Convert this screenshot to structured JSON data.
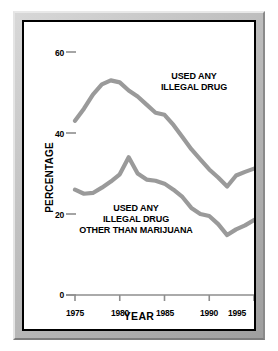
{
  "chart_data": {
    "type": "line",
    "title": "",
    "xlabel": "YEAR",
    "ylabel": "PERCENTAGE",
    "xlim": [
      1975,
      1995
    ],
    "ylim": [
      0,
      60
    ],
    "grid": false,
    "legend_position": "inline-annotation",
    "xticks": [
      "1975",
      "1980",
      "1985",
      "1990",
      "1995"
    ],
    "xtick_values": [
      1975,
      1980,
      1985,
      1990,
      1995
    ],
    "yticks": [
      "0",
      "20",
      "40",
      "60"
    ],
    "ytick_values": [
      0,
      20,
      40,
      60
    ],
    "line_color": "#9a9a9a",
    "axis_color": "#8e8e8e",
    "text_color": "#000000",
    "x": [
      1975,
      1976,
      1977,
      1978,
      1979,
      1980,
      1981,
      1982,
      1983,
      1984,
      1985,
      1986,
      1987,
      1988,
      1989,
      1990,
      1991,
      1992,
      1993,
      1994,
      1995
    ],
    "series": [
      {
        "name": "USED ANY ILLEGAL DRUG",
        "annotation": [
          "USED ANY",
          "ILLEGAL DRUG"
        ],
        "values": [
          43.0,
          46.0,
          49.5,
          52.0,
          53.0,
          52.5,
          50.5,
          49.0,
          47.0,
          45.0,
          44.5,
          42.0,
          39.0,
          36.0,
          33.5,
          31.0,
          29.0,
          26.8,
          29.5,
          30.4,
          31.2
        ]
      },
      {
        "name": "USED ANY ILLEGAL DRUG OTHER THAN MARIJUANA",
        "annotation": [
          "USED ANY",
          "ILLEGAL DRUG",
          "OTHER THAN MARIJUANA"
        ],
        "values": [
          26.0,
          25.0,
          25.2,
          26.5,
          28.0,
          29.8,
          34.0,
          30.0,
          28.5,
          28.2,
          27.5,
          26.0,
          24.2,
          21.5,
          20.0,
          19.5,
          17.5,
          14.8,
          16.2,
          17.2,
          18.5
        ]
      }
    ]
  },
  "axis": {
    "y_title": "PERCENTAGE",
    "x_title": "YEAR",
    "ytick_labels": [
      "60",
      "40",
      "20",
      "0"
    ],
    "xtick_labels": [
      "1975",
      "1980",
      "1985",
      "1990",
      "1995"
    ]
  },
  "annotations": {
    "upper_line1": "USED ANY",
    "upper_line2": "ILLEGAL DRUG",
    "lower_line1": "USED ANY",
    "lower_line2": "ILLEGAL DRUG",
    "lower_line3": "OTHER THAN MARIJUANA"
  }
}
